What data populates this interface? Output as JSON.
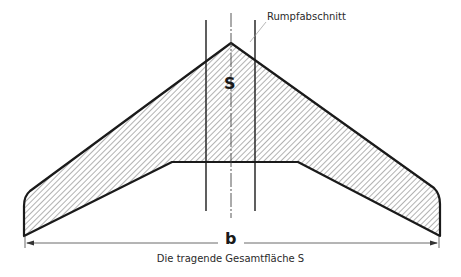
{
  "labels": {
    "fuselage_section": "Rumpfabschnitt",
    "area_symbol": "S",
    "span_symbol": "b",
    "caption": "Die tragende Gesamtfläche S"
  },
  "colors": {
    "outline": "#1a1a1a",
    "hatch": "#555555",
    "dimension": "#444444"
  }
}
